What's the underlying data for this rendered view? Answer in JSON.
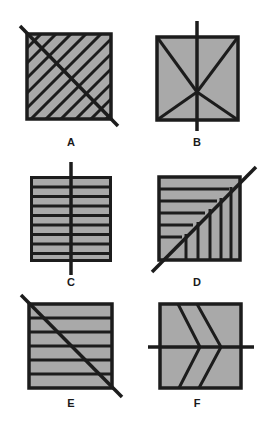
{
  "colors": {
    "fill": "#a9a9a9",
    "stroke": "#1c1c1c",
    "background": "#ffffff"
  },
  "figures": [
    {
      "id": "A",
      "label": "A",
      "description": "square with diagonal hatching and a diagonal line from top-left to bottom-right"
    },
    {
      "id": "B",
      "label": "B",
      "description": "square with two diagonals meeting below center and a vertical line"
    },
    {
      "id": "C",
      "label": "C",
      "description": "square with nine horizontal bars and a vertical line"
    },
    {
      "id": "D",
      "label": "D",
      "description": "square with horizontal lines above and vertical lines below a bottom-left to top-right diagonal"
    },
    {
      "id": "E",
      "label": "E",
      "description": "square with six horizontal bands and a diagonal line"
    },
    {
      "id": "F",
      "label": "F",
      "description": "square with two chevrons and a horizontal line"
    }
  ]
}
